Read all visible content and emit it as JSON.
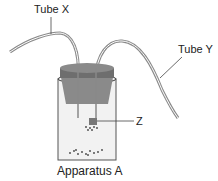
{
  "labels": {
    "tube_x": "Tube X",
    "tube_y": "Tube Y",
    "z": "Z",
    "caption": "Apparatus A"
  },
  "colors": {
    "stopper_top": "#8a8a8a",
    "stopper_side": "#6e6e6e",
    "jar_rim": "#555555",
    "tube": "#9a9a9a"
  }
}
